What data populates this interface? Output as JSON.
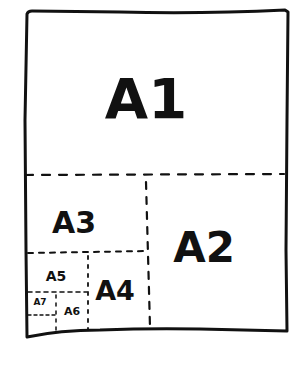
{
  "diagram": {
    "title": "",
    "style": "hand-drawn",
    "stroke_color": "#111111",
    "background": "#ffffff",
    "regions": [
      {
        "id": "a1",
        "label": "A1",
        "font_size": 56
      },
      {
        "id": "a2",
        "label": "A2",
        "font_size": 42
      },
      {
        "id": "a3",
        "label": "A3",
        "font_size": 30
      },
      {
        "id": "a4",
        "label": "A4",
        "font_size": 27
      },
      {
        "id": "a5",
        "label": "A5",
        "font_size": 14
      },
      {
        "id": "a6",
        "label": "A6",
        "font_size": 11
      },
      {
        "id": "a7",
        "label": "A7",
        "font_size": 9
      }
    ]
  }
}
